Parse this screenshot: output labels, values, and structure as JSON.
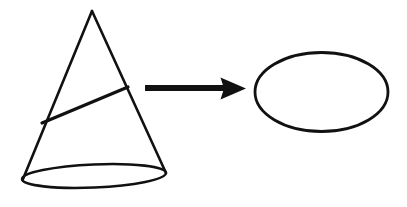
{
  "figure": {
    "background_color": "#ffffff",
    "ink_color": "#111111",
    "width": 407,
    "height": 207,
    "caption": "",
    "shapes": {
      "cone": {
        "label": "cone",
        "apex": {
          "x": 92,
          "y": 11
        },
        "base_ellipse": {
          "cx": 94,
          "cy": 176,
          "rx": 72,
          "ry": 11.5,
          "rotation_deg": -2.5,
          "stroke_width": 2.6
        },
        "left_edge": {
          "x1": 92,
          "y1": 11,
          "x2": 23,
          "y2": 179
        },
        "right_edge": {
          "x1": 92,
          "y1": 11,
          "x2": 166,
          "y2": 173
        },
        "stroke_width": 2.6
      },
      "cross_section_line": {
        "label": "cutting-plane-line",
        "x1": 42,
        "y1": 123,
        "x2": 128,
        "y2": 87,
        "stroke_width": 3.2
      },
      "arrow": {
        "label": "implies-arrow",
        "direction": "right",
        "shaft": {
          "x1": 145,
          "y1": 88,
          "x2": 224,
          "y2": 88,
          "thickness": 6
        },
        "head": {
          "tip_x": 246,
          "tip_y": 88.5,
          "back_x": 221,
          "half_height": 11
        }
      },
      "result_ellipse": {
        "label": "resulting-ellipse",
        "cx": 321.5,
        "cy": 92,
        "rx": 66.5,
        "ry": 39.5,
        "rotation_deg": 0,
        "stroke_width": 2.8
      }
    }
  }
}
